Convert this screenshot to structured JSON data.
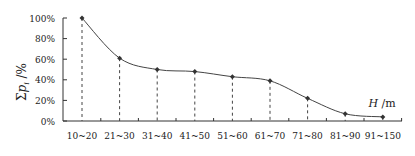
{
  "chart_data": {
    "type": "line",
    "title": "",
    "xlabel": "H /m",
    "ylabel": "Σp_i /%",
    "categories": [
      "10~20",
      "21~30",
      "31~40",
      "41~50",
      "51~60",
      "61~70",
      "71~80",
      "81~90",
      "91~150"
    ],
    "values": [
      100,
      61,
      50,
      48,
      43,
      39,
      22,
      7,
      4
    ],
    "yticks": [
      "0%",
      "20%",
      "40%",
      "60%",
      "80%",
      "100%"
    ],
    "ylim": [
      0,
      100
    ],
    "grid": false,
    "legend": null,
    "drop_lines": true
  },
  "labels": {
    "y_axis_sigma": "Σ",
    "y_axis_p": "p",
    "y_axis_sub": "i",
    "y_axis_unit": " /%",
    "x_axis_var": "H",
    "x_axis_unit": " /m"
  }
}
